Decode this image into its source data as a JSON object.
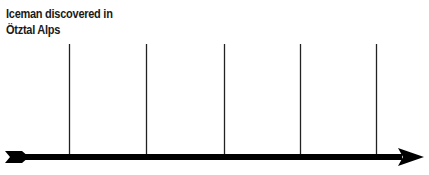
{
  "timeline": {
    "event_label_line1": "Iceman discovered in",
    "event_label_line2": "Ötztal Alps",
    "tick_count": 5,
    "colors": {
      "line": "#000000",
      "tick": "#222222",
      "background": "#ffffff"
    }
  }
}
